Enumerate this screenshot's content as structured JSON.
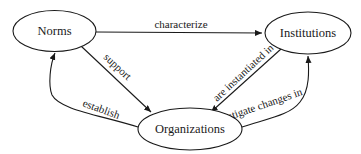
{
  "diagram": {
    "type": "concept-map",
    "nodes": [
      {
        "id": "norms",
        "label": "Norms"
      },
      {
        "id": "institutions",
        "label": "Institutions"
      },
      {
        "id": "organizations",
        "label": "Organizations"
      }
    ],
    "edges": [
      {
        "from": "norms",
        "to": "institutions",
        "label": "characterize"
      },
      {
        "from": "norms",
        "to": "organizations",
        "label": "support"
      },
      {
        "from": "institutions",
        "to": "organizations",
        "label": "are instantiated in"
      },
      {
        "from": "organizations",
        "to": "norms",
        "label": "establish"
      },
      {
        "from": "organizations",
        "to": "institutions",
        "label": "instigate changes in"
      }
    ],
    "colors": {
      "stroke": "#1a1a1a",
      "background": "#ffffff"
    }
  }
}
